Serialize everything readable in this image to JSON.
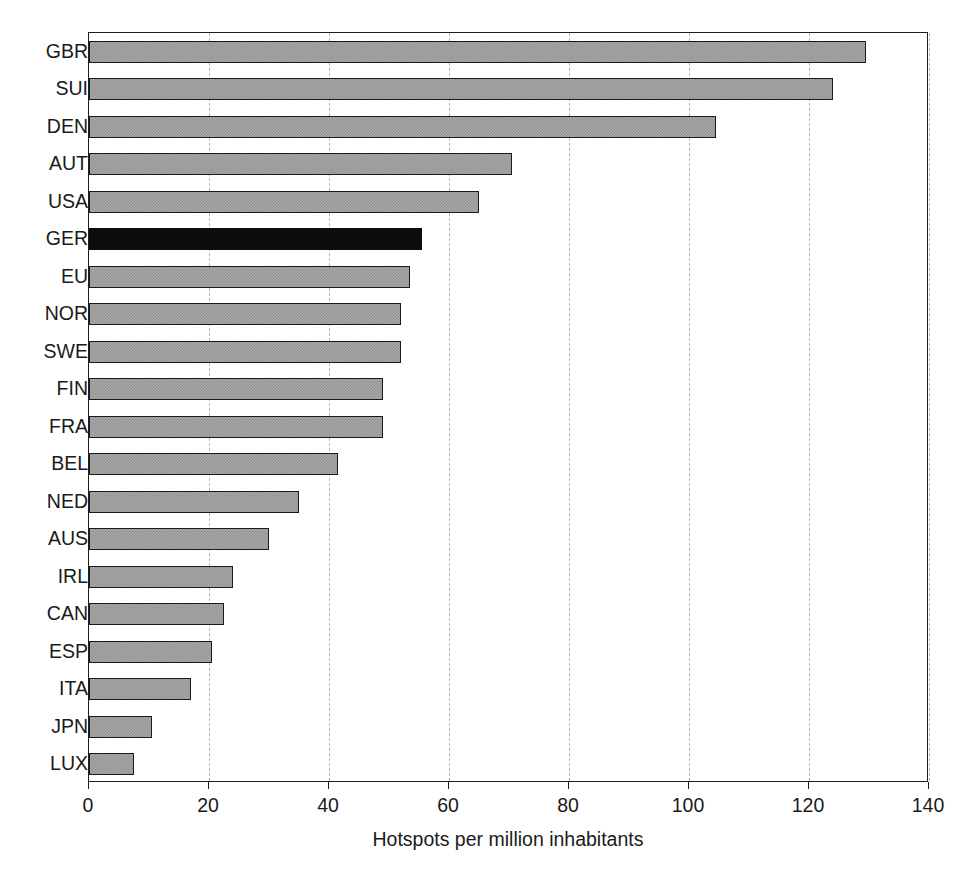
{
  "chart_data": {
    "type": "bar",
    "orientation": "horizontal",
    "title": "",
    "subtitle": "",
    "xlabel": "Hotspots per million inhabitants",
    "ylabel": "",
    "xlim": [
      0,
      140
    ],
    "xticks": [
      0,
      20,
      40,
      60,
      80,
      100,
      120,
      140
    ],
    "xticklabels": [
      "0",
      "20",
      "40",
      "60",
      "80",
      "100",
      "120",
      "140"
    ],
    "grid": "vertical-dashed",
    "legend": "none",
    "categories": [
      "GBR",
      "SUI",
      "DEN",
      "AUT",
      "USA",
      "GER",
      "EU",
      "NOR",
      "SWE",
      "FIN",
      "FRA",
      "BEL",
      "NED",
      "AUS",
      "IRL",
      "CAN",
      "ESP",
      "ITA",
      "JPN",
      "LUX"
    ],
    "values": [
      129.5,
      124,
      104.5,
      70.5,
      65,
      55.5,
      53.5,
      52,
      52,
      49,
      49,
      41.5,
      35,
      30,
      24,
      22.5,
      20.5,
      17,
      10.5,
      7.5
    ],
    "highlighted_category": "GER",
    "bar_style": {
      "default_fill": "#a9a9a9",
      "default_pattern": "checkered",
      "default_edge": "#1a1a1a",
      "highlight_fill": "#0d0d0d",
      "highlight_edge": "#0d0d0d"
    },
    "axis_color": "#1e1e1e",
    "gridline_color": "#b4b4b4"
  }
}
